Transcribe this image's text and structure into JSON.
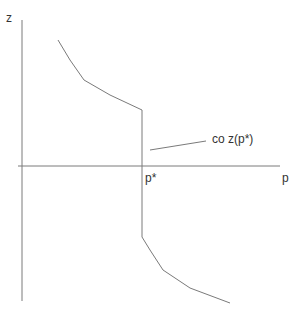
{
  "diagram": {
    "axes": {
      "y_label": "z",
      "x_label": "p"
    },
    "tick_label": "p*",
    "annotation": "co z(p*)",
    "colors": {
      "line": "#7a7a7a",
      "text": "#333333",
      "background": "#ffffff"
    },
    "curves": {
      "upper": [
        [
          58,
          40
        ],
        [
          70,
          60
        ],
        [
          84,
          80
        ],
        [
          110,
          95
        ],
        [
          142,
          110
        ],
        [
          142,
          166
        ]
      ],
      "lower": [
        [
          142,
          166
        ],
        [
          142,
          237
        ],
        [
          150,
          250
        ],
        [
          163,
          270
        ],
        [
          190,
          288
        ],
        [
          230,
          303
        ]
      ],
      "pointer": [
        [
          150,
          150
        ],
        [
          206,
          141
        ]
      ]
    }
  }
}
